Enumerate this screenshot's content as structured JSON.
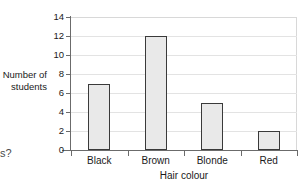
{
  "figure": {
    "background_color": "#ffffff",
    "bar_fill_color": "#e9e9e9",
    "bar_edge_color": "#3a3a3a",
    "axis_color": "#6b6b6b",
    "gridline_color": "#e3e3e3",
    "text_color": "#1a1a1a"
  },
  "page_fragments": {
    "top_left_fragment": "f",
    "bottom_left_fragment": "s?"
  },
  "chart_data": {
    "type": "bar",
    "title": "",
    "categories": [
      "Black",
      "Brown",
      "Blonde",
      "Red"
    ],
    "values": [
      7,
      12,
      5,
      2
    ],
    "xlabel": "Hair colour",
    "ylabel": "Number of students",
    "ylabel_lines": [
      "Number of",
      "students"
    ],
    "ylim": [
      0,
      14
    ],
    "ytick_values": [
      0,
      2,
      4,
      6,
      8,
      10,
      12,
      14
    ],
    "ytick_labels": [
      "0",
      "2",
      "4",
      "6",
      "8",
      "10",
      "12",
      "14"
    ],
    "ytick_interval": 2,
    "grid": true,
    "grid_axis": "y",
    "legend": false,
    "legend_position": "none",
    "orientation": "vertical"
  }
}
